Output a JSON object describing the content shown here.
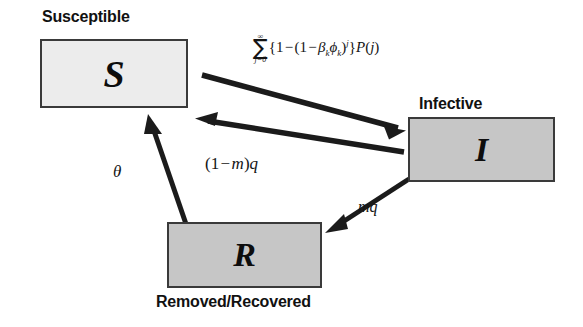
{
  "diagram": {
    "background_color": "#ffffff",
    "stroke_color": "#2b2b2b",
    "nodes": [
      {
        "id": "susceptible",
        "symbol": "S",
        "caption": "Susceptible",
        "caption_position": "above",
        "fill_color": "#ececec",
        "border_color": "#3a3a3a"
      },
      {
        "id": "infective",
        "symbol": "I",
        "caption": "Infective",
        "caption_position": "above",
        "fill_color": "#c6c6c6",
        "border_color": "#3a3a3a"
      },
      {
        "id": "removed",
        "symbol": "R",
        "caption": "Removed/Recovered",
        "caption_position": "below",
        "fill_color": "#c6c6c6",
        "border_color": "#3a3a3a"
      }
    ],
    "edges": [
      {
        "id": "s-to-i",
        "from": "susceptible",
        "to": "infective",
        "label_parts": {
          "sum_upper": "∞",
          "sum_lower": "j=0",
          "sum_sign": "∑",
          "open_brace": "{",
          "one_a": "1",
          "minus_a": "−",
          "open_paren": "(",
          "one_b": "1",
          "minus_b": "−",
          "beta": "β",
          "beta_sub": "k",
          "phi": "ϕ",
          "phi_sub": "k",
          "close_paren": ")",
          "exponent": "j",
          "close_brace": "}",
          "prob": "P",
          "prob_open": "(",
          "prob_arg": "j",
          "prob_close": ")"
        },
        "label_plain": "∑(j=0..∞) {1 − (1 − βₖϕₖ)ʲ} P(j)"
      },
      {
        "id": "i-to-s",
        "from": "infective",
        "to": "susceptible",
        "label_parts": {
          "open_paren": "(",
          "one": "1",
          "minus": "−",
          "m": "m",
          "close_paren": ")",
          "q": "q"
        },
        "label_plain": "(1 − m)q"
      },
      {
        "id": "i-to-r",
        "from": "infective",
        "to": "removed",
        "label_parts": {
          "m": "m",
          "q": "q"
        },
        "label_plain": "mq"
      },
      {
        "id": "r-to-s",
        "from": "removed",
        "to": "susceptible",
        "label_parts": {
          "theta": "θ"
        },
        "label_plain": "θ"
      }
    ]
  }
}
